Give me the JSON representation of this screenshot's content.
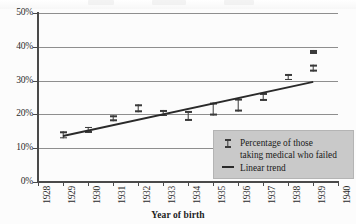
{
  "chart_data": {
    "type": "scatter",
    "title": "",
    "xlabel": "Year of birth",
    "ylabel": "",
    "xlim": [
      1928,
      1940
    ],
    "ylim": [
      0,
      50
    ],
    "y_unit": "%",
    "grid": true,
    "legend_position": "inside-bottom-right",
    "x_tick_labels": [
      "1928",
      "1929",
      "1930",
      "1931",
      "1932",
      "1933",
      "1934",
      "1935",
      "1936",
      "1937",
      "1938",
      "1939",
      "1940"
    ],
    "y_tick_labels": [
      "0%",
      "10%",
      "20%",
      "30%",
      "40%",
      "50%"
    ],
    "y_tick_values": [
      0,
      10,
      20,
      30,
      40,
      50
    ],
    "series": [
      {
        "name": "Percentage of those taking medical who failed",
        "marker": "error-bar",
        "points": [
          {
            "x": 1929,
            "y": 13.9,
            "low": 12.8,
            "high": 15.0
          },
          {
            "x": 1930,
            "y": 15.5,
            "low": 14.6,
            "high": 16.4
          },
          {
            "x": 1931,
            "y": 18.8,
            "low": 18.0,
            "high": 19.6
          },
          {
            "x": 1932,
            "y": 21.8,
            "low": 20.7,
            "high": 22.9
          },
          {
            "x": 1933,
            "y": 20.3,
            "low": 19.4,
            "high": 21.2
          },
          {
            "x": 1934,
            "y": 19.5,
            "low": 18.0,
            "high": 21.0
          },
          {
            "x": 1935,
            "y": 21.5,
            "low": 19.6,
            "high": 23.4
          },
          {
            "x": 1936,
            "y": 22.8,
            "low": 20.9,
            "high": 24.7
          },
          {
            "x": 1937,
            "y": 25.2,
            "low": 24.0,
            "high": 26.4
          },
          {
            "x": 1938,
            "y": 31.0,
            "low": 30.1,
            "high": 31.9
          },
          {
            "x": 1939,
            "y": 33.7,
            "low": 32.7,
            "high": 34.7
          },
          {
            "x": 1939,
            "y": 38.5,
            "low": 37.9,
            "high": 39.1
          }
        ]
      },
      {
        "name": "Linear trend",
        "marker": "line",
        "points": [
          {
            "x": 1929,
            "y": 14.0
          },
          {
            "x": 1939,
            "y": 30.0
          }
        ]
      }
    ]
  },
  "axes": {
    "x_title": "Year of birth"
  },
  "legend": {
    "entries": [
      {
        "key": "error-bar",
        "line1": "Percentage of those",
        "line2": "taking medical who failed"
      },
      {
        "key": "line",
        "line1": "Linear trend",
        "line2": ""
      }
    ]
  },
  "colors": {
    "marker": "#3a3a3a",
    "trend": "#2a2a2a",
    "grid": "#8e8e8e",
    "axis": "#4a4a4a",
    "legend_bg": "#c9c9c9",
    "text": "#1a1a1a",
    "background": "#fcfcfc"
  }
}
